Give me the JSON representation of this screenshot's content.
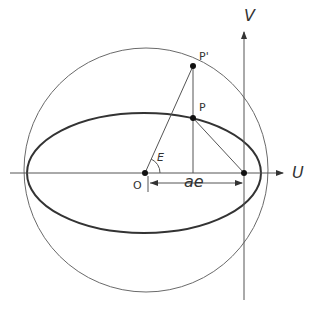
{
  "diagram": {
    "labels": {
      "u_axis": "U",
      "v_axis": "V",
      "point_p": "P",
      "point_p_prime": "P'",
      "origin": "O",
      "angle": "E",
      "distance": "ae"
    },
    "colors": {
      "circle": "#6a6a6a",
      "ellipse": "#333333",
      "lines": "#555555",
      "points": "#111111",
      "text": "#333333"
    }
  }
}
